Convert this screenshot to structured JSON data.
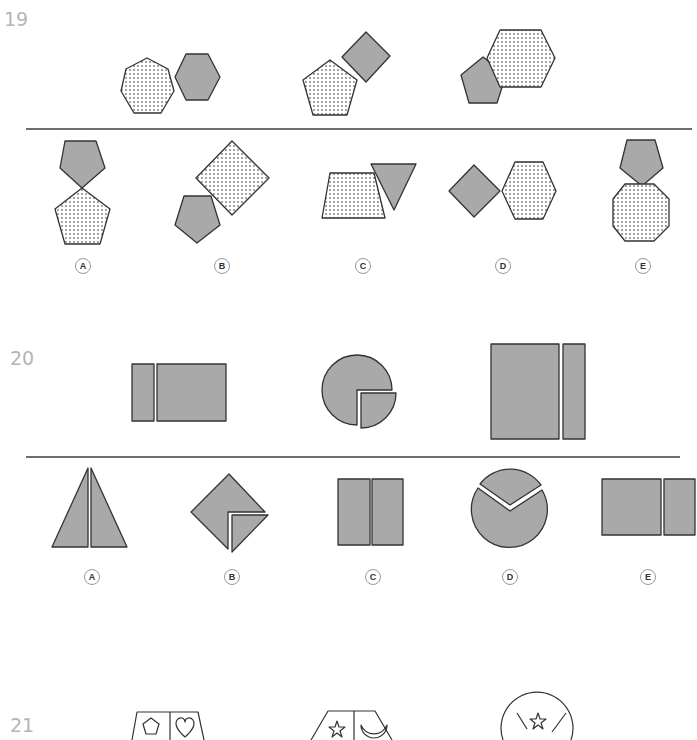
{
  "questions": [
    {
      "number": "19",
      "prompt_figures": [
        {
          "description": "dotted heptagon + gray hexagon"
        },
        {
          "description": "dotted pentagon + gray rotated square"
        },
        {
          "description": "gray pentagon + dotted hexagon"
        }
      ],
      "options": [
        {
          "label": "A",
          "description": "gray pentagon above dotted pentagon, touching at vertex"
        },
        {
          "label": "B",
          "description": "dotted rotated square with gray pentagon"
        },
        {
          "label": "C",
          "description": "dotted trapezoid + gray inverted triangle"
        },
        {
          "label": "D",
          "description": "gray rotated square + dotted hexagon"
        },
        {
          "label": "E",
          "description": "gray pentagon above dotted octagon"
        }
      ]
    },
    {
      "number": "20",
      "prompt_figures": [
        {
          "description": "narrow rectangle + wide rectangle"
        },
        {
          "description": "circle with quarter wedge pulled out"
        },
        {
          "description": "tall rectangle + narrow tall rectangle"
        }
      ],
      "options": [
        {
          "label": "A",
          "description": "triangle split vertically in two"
        },
        {
          "label": "B",
          "description": "rotated square with corner piece split"
        },
        {
          "label": "C",
          "description": "square split in two halves"
        },
        {
          "label": "D",
          "description": "circle with V-cut wedge"
        },
        {
          "label": "E",
          "description": "square + narrow rectangle"
        }
      ]
    },
    {
      "number": "21",
      "prompt_figures": [
        {
          "description": "trapezoid split with pentagon and heart"
        },
        {
          "description": "hexagonal shape with star and crescent moon"
        },
        {
          "description": "circle divided with star and other symbols"
        }
      ]
    }
  ],
  "colors": {
    "fill_gray": "#a9a9a9",
    "stroke": "#333333",
    "divider": "#6e6e6e",
    "qnum": "#b5b5b5"
  }
}
